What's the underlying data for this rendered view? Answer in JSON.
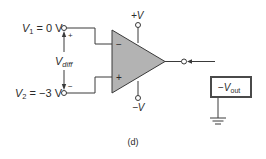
{
  "diagram": {
    "type": "op-amp differential input circuit",
    "caption": "(d)",
    "inputs": {
      "v1": {
        "symbol": "V",
        "subscript": "1",
        "value": " = 0 V",
        "polarity": "+"
      },
      "v2": {
        "symbol": "V",
        "subscript": "2",
        "value": " = −3 V",
        "polarity": "−"
      },
      "vdiff": {
        "symbol": "V",
        "subscript": "diff"
      }
    },
    "op_amp": {
      "inverting_input": "−",
      "noninverting_input": "+",
      "fill_color": "#b3b3b3",
      "supply_positive": "+V",
      "supply_negative": "−V"
    },
    "output_meter": {
      "prefix": "−",
      "symbol": "V",
      "subscript": "out",
      "box_fill": "#ffffff",
      "box_border": "#4a4a4a"
    },
    "ground": "ground-symbol"
  }
}
